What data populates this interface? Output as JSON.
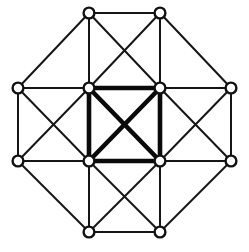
{
  "figure": {
    "type": "graph-diagram",
    "width": 249,
    "height": 252,
    "background_color": "#ffffff"
  },
  "style": {
    "thin_edge_color": "#151515",
    "thin_edge_width": 2,
    "bold_edge_color": "#0a0a0a",
    "bold_edge_width": 4.6,
    "vertex_fill": "#ffffff",
    "vertex_stroke": "#111111",
    "vertex_stroke_width": 2.4,
    "vertex_radius": 5.4
  },
  "chart_data": {
    "type": "graph",
    "grid_columns": [
      18,
      89,
      160,
      231
    ],
    "grid_rows": [
      13,
      88,
      161,
      232
    ],
    "vertex_count": 12,
    "edge_count": 32,
    "bold_edge_count": 6,
    "vertices": [
      {
        "id": "n0",
        "label": "top-left",
        "x": 89,
        "y": 13,
        "col": 1,
        "row": 0
      },
      {
        "id": "n1",
        "label": "top-right",
        "x": 160,
        "y": 13,
        "col": 2,
        "row": 0
      },
      {
        "id": "n2",
        "label": "upper-left-outer",
        "x": 18,
        "y": 88,
        "col": 0,
        "row": 1
      },
      {
        "id": "n3",
        "label": "inner-top-left",
        "x": 89,
        "y": 88,
        "col": 1,
        "row": 1
      },
      {
        "id": "n4",
        "label": "inner-top-right",
        "x": 160,
        "y": 88,
        "col": 2,
        "row": 1
      },
      {
        "id": "n5",
        "label": "upper-right-outer",
        "x": 231,
        "y": 88,
        "col": 3,
        "row": 1
      },
      {
        "id": "n6",
        "label": "lower-left-outer",
        "x": 18,
        "y": 161,
        "col": 0,
        "row": 2
      },
      {
        "id": "n7",
        "label": "inner-bottom-left",
        "x": 89,
        "y": 161,
        "col": 1,
        "row": 2
      },
      {
        "id": "n8",
        "label": "inner-bottom-right",
        "x": 160,
        "y": 161,
        "col": 2,
        "row": 2
      },
      {
        "id": "n9",
        "label": "lower-right-outer",
        "x": 231,
        "y": 161,
        "col": 3,
        "row": 2
      },
      {
        "id": "n10",
        "label": "bottom-left",
        "x": 89,
        "y": 232,
        "col": 1,
        "row": 3
      },
      {
        "id": "n11",
        "label": "bottom-right",
        "x": 160,
        "y": 232,
        "col": 2,
        "row": 3
      }
    ],
    "edges": [
      {
        "from": "n0",
        "to": "n1",
        "weight": "thin",
        "kind": "top-outer-horizontal"
      },
      {
        "from": "n10",
        "to": "n11",
        "weight": "thin",
        "kind": "bottom-outer-horizontal"
      },
      {
        "from": "n2",
        "to": "n3",
        "weight": "thin",
        "kind": "row1-horizontal-left"
      },
      {
        "from": "n4",
        "to": "n5",
        "weight": "thin",
        "kind": "row1-horizontal-right"
      },
      {
        "from": "n6",
        "to": "n7",
        "weight": "thin",
        "kind": "row2-horizontal-left"
      },
      {
        "from": "n8",
        "to": "n9",
        "weight": "thin",
        "kind": "row2-horizontal-right"
      },
      {
        "from": "n2",
        "to": "n6",
        "weight": "thin",
        "kind": "left-outer-vertical"
      },
      {
        "from": "n5",
        "to": "n9",
        "weight": "thin",
        "kind": "right-outer-vertical"
      },
      {
        "from": "n0",
        "to": "n3",
        "weight": "thin",
        "kind": "col1-vertical-top"
      },
      {
        "from": "n1",
        "to": "n4",
        "weight": "thin",
        "kind": "col2-vertical-top"
      },
      {
        "from": "n7",
        "to": "n10",
        "weight": "thin",
        "kind": "col1-vertical-bottom"
      },
      {
        "from": "n8",
        "to": "n11",
        "weight": "thin",
        "kind": "col2-vertical-bottom"
      },
      {
        "from": "n0",
        "to": "n2",
        "weight": "thin",
        "kind": "octagon-corner-top-left"
      },
      {
        "from": "n1",
        "to": "n5",
        "weight": "thin",
        "kind": "octagon-corner-top-right"
      },
      {
        "from": "n6",
        "to": "n10",
        "weight": "thin",
        "kind": "octagon-corner-bottom-left"
      },
      {
        "from": "n9",
        "to": "n11",
        "weight": "thin",
        "kind": "octagon-corner-bottom-right"
      },
      {
        "from": "n0",
        "to": "n4",
        "weight": "thin",
        "kind": "diagonal-top-cell-down-right"
      },
      {
        "from": "n1",
        "to": "n3",
        "weight": "thin",
        "kind": "diagonal-top-cell-down-left"
      },
      {
        "from": "n2",
        "to": "n7",
        "weight": "thin",
        "kind": "diagonal-left-cell-down-right"
      },
      {
        "from": "n3",
        "to": "n6",
        "weight": "thin",
        "kind": "diagonal-left-cell-down-left"
      },
      {
        "from": "n4",
        "to": "n9",
        "weight": "thin",
        "kind": "diagonal-right-cell-down-right"
      },
      {
        "from": "n5",
        "to": "n8",
        "weight": "thin",
        "kind": "diagonal-right-cell-down-left"
      },
      {
        "from": "n7",
        "to": "n11",
        "weight": "thin",
        "kind": "diagonal-bottom-cell-down-right"
      },
      {
        "from": "n8",
        "to": "n10",
        "weight": "thin",
        "kind": "diagonal-bottom-cell-down-left"
      },
      {
        "from": "n3",
        "to": "n4",
        "weight": "bold",
        "kind": "center-square-top"
      },
      {
        "from": "n7",
        "to": "n8",
        "weight": "bold",
        "kind": "center-square-bottom"
      },
      {
        "from": "n3",
        "to": "n7",
        "weight": "bold",
        "kind": "center-square-left"
      },
      {
        "from": "n4",
        "to": "n8",
        "weight": "bold",
        "kind": "center-square-right"
      },
      {
        "from": "n3",
        "to": "n8",
        "weight": "bold",
        "kind": "center-diagonal-down-right"
      },
      {
        "from": "n4",
        "to": "n7",
        "weight": "bold",
        "kind": "center-diagonal-down-left"
      }
    ]
  }
}
